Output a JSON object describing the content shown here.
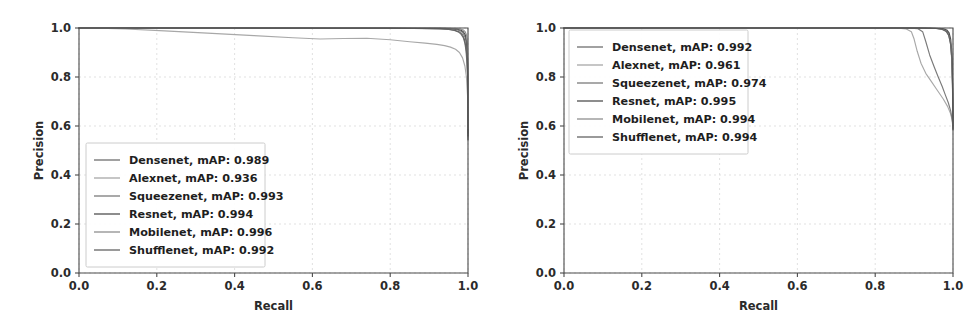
{
  "figure": {
    "type": "precision-recall-figure",
    "background": "#ffffff",
    "panel_count": 2,
    "grid_color": "#d9d9d9",
    "axis_color": "#4a4a4a",
    "text_color": "#2b2b2b"
  },
  "chart_data": [
    {
      "type": "line",
      "id": "left-precision-recall",
      "title": "",
      "xlabel": "Recall",
      "ylabel": "Precision",
      "xlim": [
        0.0,
        1.0
      ],
      "ylim": [
        0.0,
        1.0
      ],
      "xticks": [
        "0.0",
        "0.2",
        "0.4",
        "0.6",
        "0.8",
        "1.0"
      ],
      "yticks": [
        "0.0",
        "0.2",
        "0.4",
        "0.6",
        "0.8",
        "1.0"
      ],
      "xtick_values": [
        0.0,
        0.2,
        0.4,
        0.6,
        0.8,
        1.0
      ],
      "ytick_values": [
        0.0,
        0.2,
        0.4,
        0.6,
        0.8,
        1.0
      ],
      "grid": true,
      "legend_position": "lower-left",
      "series": [
        {
          "name": "Densenet",
          "map": "0.989",
          "legend": "Densenet, mAP: 0.989",
          "color": "#6e6e6e",
          "x": [
            0.0,
            0.1,
            0.25,
            0.4,
            0.55,
            0.7,
            0.8,
            0.86,
            0.9,
            0.93,
            0.95,
            0.965,
            0.975,
            0.982,
            0.988,
            0.992,
            0.995,
            0.997,
            0.999,
            1.0
          ],
          "y": [
            1.0,
            1.0,
            1.0,
            1.0,
            1.0,
            0.999,
            0.999,
            0.998,
            0.997,
            0.996,
            0.994,
            0.99,
            0.984,
            0.975,
            0.96,
            0.938,
            0.905,
            0.862,
            0.8,
            0.555
          ]
        },
        {
          "name": "Alexnet",
          "map": "0.936",
          "legend": "Alexnet, mAP: 0.936",
          "color": "#a8a8a8",
          "x": [
            0.0,
            0.05,
            0.12,
            0.22,
            0.33,
            0.45,
            0.55,
            0.62,
            0.68,
            0.74,
            0.8,
            0.85,
            0.89,
            0.92,
            0.94,
            0.955,
            0.968,
            0.978,
            0.986,
            0.992,
            0.996,
            0.999,
            1.0
          ],
          "y": [
            1.0,
            0.999,
            0.996,
            0.988,
            0.979,
            0.969,
            0.96,
            0.955,
            0.957,
            0.958,
            0.952,
            0.944,
            0.938,
            0.933,
            0.928,
            0.922,
            0.913,
            0.9,
            0.878,
            0.845,
            0.8,
            0.72,
            0.54
          ]
        },
        {
          "name": "Squeezenet",
          "map": "0.993",
          "legend": "Squeezenet, mAP: 0.993",
          "color": "#7a7a7a",
          "x": [
            0.0,
            0.15,
            0.35,
            0.55,
            0.72,
            0.84,
            0.9,
            0.935,
            0.958,
            0.972,
            0.982,
            0.988,
            0.993,
            0.996,
            0.998,
            0.999,
            1.0
          ],
          "y": [
            1.0,
            1.0,
            1.0,
            1.0,
            1.0,
            0.999,
            0.999,
            0.998,
            0.996,
            0.993,
            0.987,
            0.977,
            0.96,
            0.935,
            0.898,
            0.845,
            0.57
          ]
        },
        {
          "name": "Resnet",
          "map": "0.994",
          "legend": "Resnet, mAP: 0.994",
          "color": "#4f4f4f",
          "x": [
            0.0,
            0.2,
            0.45,
            0.65,
            0.8,
            0.89,
            0.93,
            0.955,
            0.97,
            0.981,
            0.988,
            0.993,
            0.996,
            0.998,
            0.9995,
            1.0
          ],
          "y": [
            1.0,
            1.0,
            1.0,
            1.0,
            1.0,
            0.999,
            0.999,
            0.998,
            0.996,
            0.992,
            0.985,
            0.972,
            0.95,
            0.91,
            0.84,
            0.56
          ]
        },
        {
          "name": "Mobilenet",
          "map": "0.996",
          "legend": "Mobilenet, mAP: 0.996",
          "color": "#8f8f8f",
          "x": [
            0.0,
            0.25,
            0.5,
            0.7,
            0.85,
            0.92,
            0.95,
            0.968,
            0.98,
            0.988,
            0.993,
            0.9965,
            0.9985,
            0.9995,
            1.0
          ],
          "y": [
            1.0,
            1.0,
            1.0,
            1.0,
            1.0,
            1.0,
            0.999,
            0.998,
            0.996,
            0.992,
            0.984,
            0.97,
            0.935,
            0.87,
            0.59
          ]
        },
        {
          "name": "Shufflenet",
          "map": "0.992",
          "legend": "Shufflenet, mAP: 0.992",
          "color": "#636363",
          "x": [
            0.0,
            0.18,
            0.4,
            0.6,
            0.78,
            0.88,
            0.925,
            0.95,
            0.966,
            0.978,
            0.986,
            0.991,
            0.995,
            0.9975,
            0.999,
            1.0
          ],
          "y": [
            1.0,
            1.0,
            1.0,
            0.999,
            0.999,
            0.998,
            0.997,
            0.995,
            0.991,
            0.984,
            0.972,
            0.953,
            0.92,
            0.875,
            0.805,
            0.545
          ]
        }
      ]
    },
    {
      "type": "line",
      "id": "right-precision-recall",
      "title": "",
      "xlabel": "Recall",
      "ylabel": "Precision",
      "xlim": [
        0.0,
        1.0
      ],
      "ylim": [
        0.0,
        1.0
      ],
      "xticks": [
        "0.0",
        "0.2",
        "0.4",
        "0.6",
        "0.8",
        "1.0"
      ],
      "yticks": [
        "0.0",
        "0.2",
        "0.4",
        "0.6",
        "0.8",
        "1.0"
      ],
      "xtick_values": [
        0.0,
        0.2,
        0.4,
        0.6,
        0.8,
        1.0
      ],
      "ytick_values": [
        0.0,
        0.2,
        0.4,
        0.6,
        0.8,
        1.0
      ],
      "grid": true,
      "legend_position": "upper-left",
      "series": [
        {
          "name": "Densenet",
          "map": "0.992",
          "legend": "Densenet, mAP: 0.992",
          "color": "#6e6e6e",
          "x": [
            0.0,
            0.3,
            0.6,
            0.8,
            0.9,
            0.94,
            0.96,
            0.972,
            0.98,
            0.986,
            0.991,
            0.995,
            0.998,
            0.9995,
            1.0
          ],
          "y": [
            1.0,
            1.0,
            1.0,
            1.0,
            1.0,
            0.999,
            0.998,
            0.996,
            0.992,
            0.983,
            0.965,
            0.92,
            0.83,
            0.7,
            0.585
          ]
        },
        {
          "name": "Alexnet",
          "map": "0.961",
          "legend": "Alexnet, mAP: 0.961",
          "color": "#a8a8a8",
          "x": [
            0.0,
            0.3,
            0.6,
            0.8,
            0.86,
            0.88,
            0.893,
            0.9,
            0.908,
            0.918,
            0.93,
            0.945,
            0.96,
            0.975,
            0.986,
            0.994,
            0.999,
            1.0
          ],
          "y": [
            1.0,
            1.0,
            1.0,
            1.0,
            0.999,
            0.996,
            0.985,
            0.955,
            0.905,
            0.855,
            0.815,
            0.78,
            0.745,
            0.71,
            0.68,
            0.65,
            0.615,
            0.585
          ]
        },
        {
          "name": "Squeezenet",
          "map": "0.974",
          "legend": "Squeezenet, mAP: 0.974",
          "color": "#7a7a7a",
          "x": [
            0.0,
            0.3,
            0.6,
            0.82,
            0.89,
            0.91,
            0.922,
            0.93,
            0.94,
            0.952,
            0.962,
            0.972,
            0.98,
            0.988,
            0.994,
            0.998,
            1.0
          ],
          "y": [
            1.0,
            1.0,
            1.0,
            1.0,
            0.999,
            0.997,
            0.985,
            0.945,
            0.89,
            0.84,
            0.8,
            0.762,
            0.728,
            0.695,
            0.662,
            0.625,
            0.585
          ]
        },
        {
          "name": "Resnet",
          "map": "0.995",
          "legend": "Resnet, mAP: 0.995",
          "color": "#4f4f4f",
          "x": [
            0.0,
            0.35,
            0.65,
            0.85,
            0.93,
            0.96,
            0.975,
            0.984,
            0.99,
            0.994,
            0.997,
            0.9988,
            1.0
          ],
          "y": [
            1.0,
            1.0,
            1.0,
            1.0,
            1.0,
            0.999,
            0.997,
            0.992,
            0.98,
            0.955,
            0.9,
            0.79,
            0.6
          ]
        },
        {
          "name": "Mobilenet",
          "map": "0.994",
          "legend": "Mobilenet, mAP: 0.994",
          "color": "#8f8f8f",
          "x": [
            0.0,
            0.35,
            0.65,
            0.85,
            0.925,
            0.955,
            0.971,
            0.981,
            0.988,
            0.993,
            0.9965,
            0.9985,
            1.0
          ],
          "y": [
            1.0,
            1.0,
            1.0,
            1.0,
            0.999,
            0.998,
            0.995,
            0.988,
            0.974,
            0.945,
            0.885,
            0.775,
            0.595
          ]
        },
        {
          "name": "Shufflenet",
          "map": "0.994",
          "legend": "Shufflenet, mAP: 0.994",
          "color": "#636363",
          "x": [
            0.0,
            0.35,
            0.65,
            0.85,
            0.928,
            0.958,
            0.973,
            0.983,
            0.989,
            0.9935,
            0.997,
            0.9988,
            1.0
          ],
          "y": [
            1.0,
            1.0,
            1.0,
            1.0,
            0.999,
            0.998,
            0.994,
            0.986,
            0.97,
            0.938,
            0.875,
            0.765,
            0.59
          ]
        }
      ]
    }
  ]
}
